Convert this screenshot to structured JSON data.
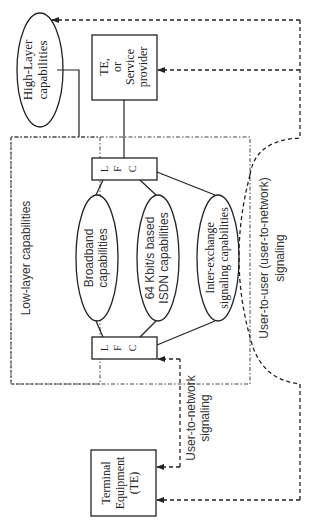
{
  "diagram": {
    "orientation": "rotated-90-ccw",
    "nodes": {
      "high_layer": {
        "label_line1": "High-Layer",
        "label_line2": "capabilities"
      },
      "te_provider": {
        "label_line1": "TE,",
        "label_line2": "or",
        "label_line3": "Service",
        "label_line4": "provider"
      },
      "lfc_top": {
        "l": "L",
        "f": "F",
        "c": "C"
      },
      "lfc_bottom": {
        "l": "L",
        "f": "F",
        "c": "C"
      },
      "broadband": {
        "label_line1": "Broadband",
        "label_line2": "capabilities"
      },
      "isdn": {
        "label_line1": "64 Kbit/s based",
        "label_line2": "ISDN capabilities"
      },
      "inter_exchange": {
        "label_line1": "Inter-exchange",
        "label_line2": "signaling capabilities"
      },
      "terminal": {
        "label_line1": "Terminal",
        "label_line2": "Equipment",
        "label_line3": "(TE)"
      }
    },
    "regions": {
      "low_layer": {
        "label": "Low-layer capabilities"
      }
    },
    "edge_labels": {
      "user_to_network": {
        "line1": "User-to-network",
        "line2": "signaling"
      },
      "user_to_user": {
        "line1": "User-to-user (user-to-network)",
        "line2": "signaling"
      }
    }
  }
}
